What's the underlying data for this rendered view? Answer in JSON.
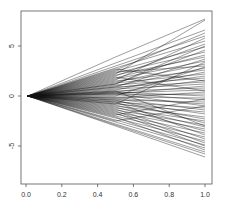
{
  "chart_data": {
    "type": "line",
    "title": "",
    "xlabel": "",
    "ylabel": "",
    "xlim": [
      -0.04,
      1.04
    ],
    "ylim": [
      -8.8,
      8.5
    ],
    "grid": false,
    "legend": null,
    "x_ticks": [
      0.0,
      0.2,
      0.4,
      0.6,
      0.8,
      1.0
    ],
    "x_tick_labels": [
      "0.0",
      "0.2",
      "0.4",
      "0.6",
      "0.8",
      "1.0"
    ],
    "y_ticks": [
      5,
      0,
      -5
    ],
    "y_tick_labels": [
      "5",
      "0",
      "-5"
    ],
    "x": [
      0.01,
      0.5,
      1.0
    ],
    "series": [
      {
        "name": "path-1",
        "values": [
          0,
          3.9,
          7.7
        ]
      },
      {
        "name": "path-2",
        "values": [
          0,
          2.2,
          7.6
        ]
      },
      {
        "name": "path-3",
        "values": [
          0,
          3.3,
          6.6
        ]
      },
      {
        "name": "path-4",
        "values": [
          0,
          2.6,
          6.3
        ]
      },
      {
        "name": "path-5",
        "values": [
          0,
          3.0,
          6.0
        ]
      },
      {
        "name": "path-6",
        "values": [
          0,
          1.6,
          5.8
        ]
      },
      {
        "name": "path-7",
        "values": [
          0,
          2.8,
          5.5
        ]
      },
      {
        "name": "path-8",
        "values": [
          0,
          2.0,
          5.2
        ]
      },
      {
        "name": "path-9",
        "values": [
          0,
          2.5,
          4.9
        ]
      },
      {
        "name": "path-10",
        "values": [
          0,
          1.2,
          4.6
        ]
      },
      {
        "name": "path-11",
        "values": [
          0,
          2.3,
          4.4
        ]
      },
      {
        "name": "path-12",
        "values": [
          0,
          1.8,
          4.1
        ]
      },
      {
        "name": "path-13",
        "values": [
          0,
          2.1,
          3.9
        ]
      },
      {
        "name": "path-14",
        "values": [
          0,
          0.9,
          3.7
        ]
      },
      {
        "name": "path-15",
        "values": [
          0,
          1.7,
          3.5
        ]
      },
      {
        "name": "path-16",
        "values": [
          0,
          1.4,
          3.2
        ]
      },
      {
        "name": "path-17",
        "values": [
          0,
          2.4,
          3.0
        ]
      },
      {
        "name": "path-18",
        "values": [
          0,
          1.0,
          2.8
        ]
      },
      {
        "name": "path-19",
        "values": [
          0,
          1.5,
          2.6
        ]
      },
      {
        "name": "path-20",
        "values": [
          0,
          0.6,
          2.4
        ]
      },
      {
        "name": "path-21",
        "values": [
          0,
          1.3,
          2.2
        ]
      },
      {
        "name": "path-22",
        "values": [
          0,
          0.8,
          2.0
        ]
      },
      {
        "name": "path-23",
        "values": [
          0,
          1.1,
          1.8
        ]
      },
      {
        "name": "path-24",
        "values": [
          0,
          0.4,
          1.6
        ]
      },
      {
        "name": "path-25",
        "values": [
          0,
          0.9,
          1.4
        ]
      },
      {
        "name": "path-26",
        "values": [
          0,
          0.7,
          1.2
        ]
      },
      {
        "name": "path-27",
        "values": [
          0,
          0.2,
          1.0
        ]
      },
      {
        "name": "path-28",
        "values": [
          0,
          0.5,
          0.8
        ]
      },
      {
        "name": "path-29",
        "values": [
          0,
          0.3,
          0.6
        ]
      },
      {
        "name": "path-30",
        "values": [
          0,
          -0.2,
          0.4
        ]
      },
      {
        "name": "path-31",
        "values": [
          0,
          0.1,
          0.2
        ]
      },
      {
        "name": "path-32",
        "values": [
          0,
          0.4,
          0.0
        ]
      },
      {
        "name": "path-33",
        "values": [
          0,
          -0.1,
          -0.2
        ]
      },
      {
        "name": "path-34",
        "values": [
          0,
          0.3,
          -0.4
        ]
      },
      {
        "name": "path-35",
        "values": [
          0,
          -0.4,
          -0.6
        ]
      },
      {
        "name": "path-36",
        "values": [
          0,
          -0.2,
          -0.8
        ]
      },
      {
        "name": "path-37",
        "values": [
          0,
          0.2,
          -1.0
        ]
      },
      {
        "name": "path-38",
        "values": [
          0,
          -0.6,
          -1.2
        ]
      },
      {
        "name": "path-39",
        "values": [
          0,
          -0.3,
          -1.4
        ]
      },
      {
        "name": "path-40",
        "values": [
          0,
          -0.8,
          -1.6
        ]
      },
      {
        "name": "path-41",
        "values": [
          0,
          -0.5,
          -1.8
        ]
      },
      {
        "name": "path-42",
        "values": [
          0,
          -1.0,
          -2.1
        ]
      },
      {
        "name": "path-43",
        "values": [
          0,
          -0.7,
          -2.3
        ]
      },
      {
        "name": "path-44",
        "values": [
          0,
          -1.2,
          -2.5
        ]
      },
      {
        "name": "path-45",
        "values": [
          0,
          -0.4,
          -2.7
        ]
      },
      {
        "name": "path-46",
        "values": [
          0,
          -1.4,
          -2.9
        ]
      },
      {
        "name": "path-47",
        "values": [
          0,
          -0.9,
          -3.1
        ]
      },
      {
        "name": "path-48",
        "values": [
          0,
          -1.6,
          -3.3
        ]
      },
      {
        "name": "path-49",
        "values": [
          0,
          -1.1,
          -3.5
        ]
      },
      {
        "name": "path-50",
        "values": [
          0,
          -1.8,
          -3.7
        ]
      },
      {
        "name": "path-51",
        "values": [
          0,
          -0.6,
          -3.9
        ]
      },
      {
        "name": "path-52",
        "values": [
          0,
          -2.0,
          -4.1
        ]
      },
      {
        "name": "path-53",
        "values": [
          0,
          -1.3,
          -4.3
        ]
      },
      {
        "name": "path-54",
        "values": [
          0,
          -2.2,
          -4.5
        ]
      },
      {
        "name": "path-55",
        "values": [
          0,
          -1.5,
          -4.7
        ]
      },
      {
        "name": "path-56",
        "values": [
          0,
          -2.4,
          -4.9
        ]
      },
      {
        "name": "path-57",
        "values": [
          0,
          -2.6,
          -5.2
        ]
      },
      {
        "name": "path-58",
        "values": [
          0,
          -2.1,
          -5.4
        ]
      },
      {
        "name": "path-59",
        "values": [
          0,
          -2.8,
          -5.6
        ]
      },
      {
        "name": "path-60",
        "values": [
          0,
          -2.9,
          -5.8
        ]
      },
      {
        "name": "path-61",
        "values": [
          0,
          -3.0,
          -6.1
        ]
      },
      {
        "name": "path-62",
        "values": [
          0,
          1.9,
          0.5
        ]
      },
      {
        "name": "path-63",
        "values": [
          0,
          -1.9,
          -0.3
        ]
      },
      {
        "name": "path-64",
        "values": [
          0,
          1.2,
          5.0
        ]
      },
      {
        "name": "path-65",
        "values": [
          0,
          -0.8,
          3.4
        ]
      },
      {
        "name": "path-66",
        "values": [
          0,
          0.5,
          -3.0
        ]
      },
      {
        "name": "path-67",
        "values": [
          0,
          2.7,
          1.5
        ]
      },
      {
        "name": "path-68",
        "values": [
          0,
          -2.5,
          -1.0
        ]
      },
      {
        "name": "path-69",
        "values": [
          0,
          0.0,
          2.9
        ]
      },
      {
        "name": "path-70",
        "values": [
          0,
          -1.7,
          -5.0
        ]
      }
    ]
  }
}
